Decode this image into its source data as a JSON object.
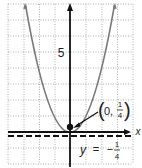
{
  "figure": {
    "type": "parabola-graph",
    "equation": "y = x^2",
    "colors": {
      "curve": "#7a7a7a",
      "axis": "#111111",
      "grid": "#9a9a9a",
      "directrix": "#111111",
      "text": "#222222"
    },
    "axes": {
      "x_label": "x",
      "y_tick_label": "5",
      "x_range": [
        -4,
        4
      ],
      "y_range": [
        -2,
        8
      ],
      "grid_unit": 1
    },
    "focus": {
      "label_open": "(",
      "label_x": "0,",
      "label_num": "1",
      "label_den": "4",
      "label_close": ")",
      "point": [
        0,
        0.25
      ]
    },
    "directrix": {
      "label_var": "y",
      "label_eq": "=",
      "label_sign": "−",
      "label_num": "1",
      "label_den": "4",
      "value": -0.25
    }
  }
}
